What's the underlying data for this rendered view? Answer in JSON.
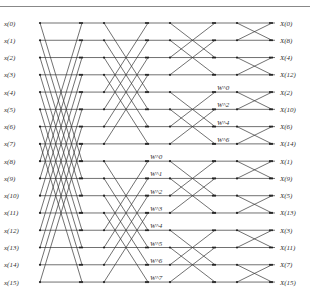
{
  "diagram": {
    "type": "16-point FFT butterfly (decimation in frequency)",
    "inputs": [
      "x(0)",
      "x(1)",
      "x(2)",
      "x(3)",
      "x(4)",
      "x(5)",
      "x(6)",
      "x(7)",
      "x(8)",
      "x(9)",
      "x(10)",
      "x(11)",
      "x(12)",
      "x(13)",
      "x(14)",
      "x(15)"
    ],
    "outputs": [
      "X(0)",
      "X(8)",
      "X(4)",
      "X(12)",
      "X(2)",
      "X(10)",
      "X(6)",
      "X(14)",
      "X(1)",
      "X(9)",
      "X(5)",
      "X(13)",
      "X(3)",
      "X(11)",
      "X(7)",
      "X(15)"
    ],
    "stage1_twiddles": [
      "W^0",
      "W^1",
      "W^2",
      "W^3",
      "W^4",
      "W^5",
      "W^6",
      "W^7"
    ],
    "stage2_twiddles": [
      "W^0",
      "W^2",
      "W^4",
      "W^6"
    ]
  }
}
